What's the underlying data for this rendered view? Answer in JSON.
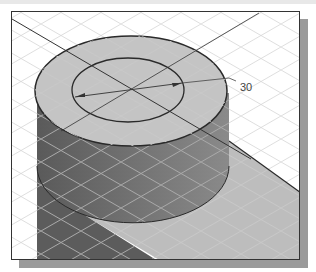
{
  "figure": {
    "dimension_label": "30",
    "colors": {
      "frame_border": "#333333",
      "frame_shadow": "#9a9a9a",
      "top_face": "#c4c4c4",
      "side_face": "#6e6e6e",
      "shadow_region": "#bdbdbd",
      "grid_line": "#dcdcdc",
      "edge_line": "#2a2a2a"
    }
  }
}
